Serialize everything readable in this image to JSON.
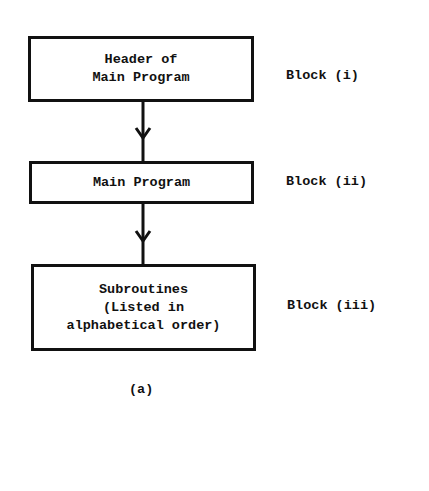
{
  "diagram": {
    "nodes": [
      {
        "id": "header",
        "text": "Header of\nMain Program",
        "block_label": "Block (i)"
      },
      {
        "id": "main",
        "text": "Main Program",
        "block_label": "Block (ii)"
      },
      {
        "id": "subroutines",
        "text": "Subroutines\n(Listed in\nalphabetical order)",
        "block_label": "Block (iii)"
      }
    ],
    "edges": [
      {
        "from": "header",
        "to": "main"
      },
      {
        "from": "main",
        "to": "subroutines"
      }
    ],
    "caption": "(a)",
    "colors": {
      "line": "#111111",
      "background": "#ffffff"
    }
  }
}
